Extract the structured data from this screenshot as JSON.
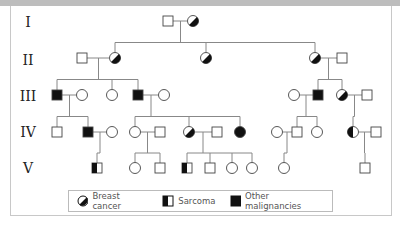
{
  "generations": [
    "I",
    "II",
    "III",
    "IV",
    "V"
  ],
  "legend": {
    "breast_cancer": "Breast cancer",
    "sarcoma": "Sarcoma",
    "other_malignancies": "Other malignancies"
  },
  "colors": {
    "line": "#888888",
    "fill": "#111111",
    "outline": "#444444"
  },
  "individuals": [
    {
      "id": "I1",
      "gen": 1,
      "sex": "M",
      "status": "unaffected"
    },
    {
      "id": "I2",
      "gen": 1,
      "sex": "F",
      "status": "breast"
    },
    {
      "id": "II1",
      "gen": 2,
      "sex": "M",
      "status": "unaffected"
    },
    {
      "id": "II2",
      "gen": 2,
      "sex": "F",
      "status": "breast"
    },
    {
      "id": "II3",
      "gen": 2,
      "sex": "F",
      "status": "breast"
    },
    {
      "id": "II4",
      "gen": 2,
      "sex": "F",
      "status": "breast"
    },
    {
      "id": "II5",
      "gen": 2,
      "sex": "M",
      "status": "unaffected"
    },
    {
      "id": "III1",
      "gen": 3,
      "sex": "M",
      "status": "other"
    },
    {
      "id": "III2",
      "gen": 3,
      "sex": "F",
      "status": "unaffected"
    },
    {
      "id": "III3",
      "gen": 3,
      "sex": "F",
      "status": "unaffected"
    },
    {
      "id": "III4",
      "gen": 3,
      "sex": "M",
      "status": "other"
    },
    {
      "id": "III5",
      "gen": 3,
      "sex": "F",
      "status": "unaffected"
    },
    {
      "id": "III6",
      "gen": 3,
      "sex": "F",
      "status": "unaffected"
    },
    {
      "id": "III7",
      "gen": 3,
      "sex": "M",
      "status": "other"
    },
    {
      "id": "III8",
      "gen": 3,
      "sex": "F",
      "status": "breast"
    },
    {
      "id": "III9",
      "gen": 3,
      "sex": "M",
      "status": "unaffected"
    },
    {
      "id": "IV1",
      "gen": 4,
      "sex": "M",
      "status": "unaffected"
    },
    {
      "id": "IV2",
      "gen": 4,
      "sex": "M",
      "status": "other"
    },
    {
      "id": "IV3",
      "gen": 4,
      "sex": "F",
      "status": "unaffected"
    },
    {
      "id": "IV4",
      "gen": 4,
      "sex": "F",
      "status": "unaffected"
    },
    {
      "id": "IV5",
      "gen": 4,
      "sex": "M",
      "status": "unaffected"
    },
    {
      "id": "IV6",
      "gen": 4,
      "sex": "F",
      "status": "breast"
    },
    {
      "id": "IV7",
      "gen": 4,
      "sex": "M",
      "status": "unaffected"
    },
    {
      "id": "IV8",
      "gen": 4,
      "sex": "F",
      "status": "other"
    },
    {
      "id": "IV9",
      "gen": 4,
      "sex": "F",
      "status": "unaffected"
    },
    {
      "id": "IV10",
      "gen": 4,
      "sex": "M",
      "status": "unaffected"
    },
    {
      "id": "IV11",
      "gen": 4,
      "sex": "F",
      "status": "unaffected"
    },
    {
      "id": "IV12",
      "gen": 4,
      "sex": "F",
      "status": "sarcoma"
    },
    {
      "id": "IV13",
      "gen": 4,
      "sex": "M",
      "status": "unaffected"
    },
    {
      "id": "V1",
      "gen": 5,
      "sex": "M",
      "status": "sarcoma"
    },
    {
      "id": "V2",
      "gen": 5,
      "sex": "F",
      "status": "unaffected"
    },
    {
      "id": "V3",
      "gen": 5,
      "sex": "M",
      "status": "unaffected"
    },
    {
      "id": "V4",
      "gen": 5,
      "sex": "M",
      "status": "sarcoma"
    },
    {
      "id": "V5",
      "gen": 5,
      "sex": "M",
      "status": "unaffected"
    },
    {
      "id": "V6",
      "gen": 5,
      "sex": "F",
      "status": "unaffected"
    },
    {
      "id": "V7",
      "gen": 5,
      "sex": "F",
      "status": "unaffected"
    },
    {
      "id": "V8",
      "gen": 5,
      "sex": "F",
      "status": "unaffected"
    },
    {
      "id": "V9",
      "gen": 5,
      "sex": "M",
      "status": "unaffected"
    }
  ],
  "couples": [
    {
      "a": "I1",
      "b": "I2",
      "children": [
        "II2",
        "II3",
        "II4"
      ]
    },
    {
      "a": "II1",
      "b": "II2",
      "children": [
        "III1",
        "III3",
        "III4"
      ]
    },
    {
      "a": "II4",
      "b": "II5",
      "children": [
        "III7",
        "III8"
      ]
    },
    {
      "a": "III1",
      "b": "III2",
      "children": [
        "IV1",
        "IV2"
      ]
    },
    {
      "a": "III4",
      "b": "III5",
      "children": [
        "IV4",
        "IV6",
        "IV8"
      ]
    },
    {
      "a": "III6",
      "b": "III7",
      "children": [
        "IV10",
        "IV11"
      ]
    },
    {
      "a": "III8",
      "b": "III9",
      "children": [
        "IV12"
      ]
    },
    {
      "a": "IV2",
      "b": "IV3",
      "children": [
        "V1"
      ]
    },
    {
      "a": "IV4",
      "b": "IV5",
      "children": [
        "V2",
        "V3"
      ]
    },
    {
      "a": "IV6",
      "b": "IV7",
      "children": [
        "V4",
        "V5",
        "V6",
        "V7"
      ]
    },
    {
      "a": "IV9",
      "b": "IV10",
      "children": [
        "V8"
      ]
    },
    {
      "a": "IV12",
      "b": "IV13",
      "children": [
        "V9"
      ]
    }
  ]
}
